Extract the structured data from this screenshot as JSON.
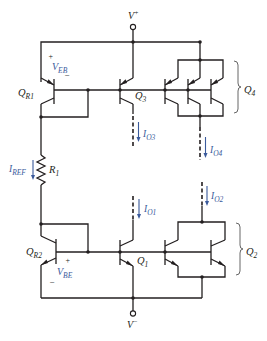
{
  "diagram": {
    "type": "circuit-schematic",
    "title": "",
    "supplies": {
      "positive": {
        "main": "V",
        "sup": "+"
      },
      "negative": {
        "main": "V",
        "sup": "−"
      }
    },
    "transistors": {
      "QR1": {
        "main": "Q",
        "sub": "R1",
        "type": "pnp"
      },
      "Q3": {
        "main": "Q",
        "sub": "3",
        "type": "pnp"
      },
      "Q4": {
        "main": "Q",
        "sub": "4",
        "type": "pnp",
        "count": 3
      },
      "QR2": {
        "main": "Q",
        "sub": "R2",
        "type": "npn"
      },
      "Q1": {
        "main": "Q",
        "sub": "1",
        "type": "npn"
      },
      "Q2": {
        "main": "Q",
        "sub": "2",
        "type": "npn",
        "count": 2
      }
    },
    "resistor": {
      "main": "R",
      "sub": "1"
    },
    "voltages": {
      "VEB": {
        "main": "V",
        "sub": "EB",
        "plus": "+",
        "minus": "−"
      },
      "VBE": {
        "main": "V",
        "sub": "BE",
        "plus": "+",
        "minus": "−"
      }
    },
    "currents": {
      "IREF": {
        "main": "I",
        "sub": "REF"
      },
      "IO3": {
        "main": "I",
        "sub": "O3"
      },
      "IO4": {
        "main": "I",
        "sub": "O4"
      },
      "IO2": {
        "main": "I",
        "sub": "O2"
      },
      "IO1": {
        "main": "I",
        "sub": "O1"
      }
    },
    "colors": {
      "wire": "#231f20",
      "annotation": "#3a5a9c"
    }
  }
}
